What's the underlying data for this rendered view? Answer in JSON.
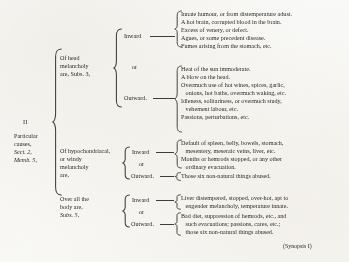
{
  "document": {
    "title": "Particular causes of melancholy — synopsis bracket table",
    "roman_numeral": "II",
    "source_note": "(Synopsis I)"
  },
  "root": {
    "label_lines": [
      "Particular",
      "causes,",
      "Sect. 2,",
      "Memb. 5,"
    ],
    "italic_lines": [
      "Sect.",
      "Memb."
    ]
  },
  "branches": [
    {
      "id": "head-melancholy",
      "label_lines": [
        "Of head",
        "melancholy",
        "are, Subs. 3,"
      ],
      "subgroups": [
        {
          "id": "head-inward",
          "label": "Inward",
          "connector": "or",
          "items": [
            "Innate humour, or from distemperature adust.",
            "A hot brain, corrupted blood in the brain.",
            "Excess of venery, or defect.",
            "Agues, or some precedent disease.",
            "Fumes arising from the stomach, etc."
          ]
        },
        {
          "id": "head-outward",
          "label": "Outward.",
          "items": [
            "Heat of the sun immoderate.",
            "A blow on the head.",
            "Overmuch use of hot wines, spices, garlic,",
            "   onions, hot baths, overmuch waking, etc.",
            "Idleness, solitariness, or overmuch study,",
            "   vehement labour, etc.",
            "Passions, perturbations, etc."
          ]
        }
      ]
    },
    {
      "id": "hypochondriacal-melancholy",
      "label_lines": [
        "Of hypochondriacal,",
        "or windy",
        "melancholy",
        "are,"
      ],
      "subgroups": [
        {
          "id": "hypo-inward",
          "label": "Inward",
          "connector": "or",
          "items": [
            "Default of spleen, belly, bowels, stomach,",
            "   mesentery, meseraic veins, liver, etc.",
            "Months or hemrods stopped, or any other",
            "   ordinary evacuation."
          ]
        },
        {
          "id": "hypo-outward",
          "label": "Outward.",
          "items": [
            "Those six non-natural things abused."
          ]
        }
      ]
    },
    {
      "id": "over-all-the-body",
      "label_lines": [
        "Over all the",
        "body are,",
        "Subs. 5,"
      ],
      "italic_lines": [
        "Subs."
      ],
      "subgroups": [
        {
          "id": "body-inward",
          "label": "Inward",
          "connector": "or",
          "items": [
            "Liver distempered, stopped, over-hot, apt to",
            "   engender melancholy, temperature innate."
          ]
        },
        {
          "id": "body-outward",
          "label": "Outward.",
          "items": [
            "Bad diet, suppression of hemrods, etc., and",
            "   such evacuations; passions, cares, etc.;",
            "   those six non-natural things abused."
          ]
        }
      ]
    }
  ]
}
